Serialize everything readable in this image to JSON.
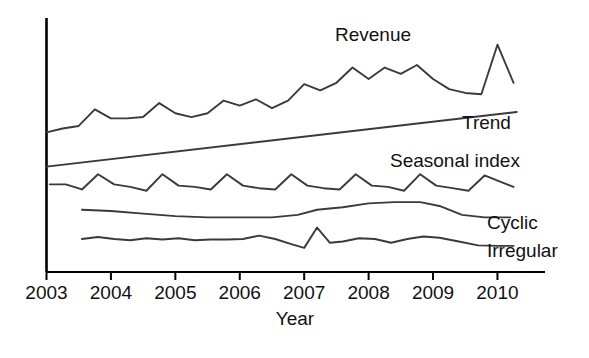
{
  "chart_data": {
    "type": "line",
    "title": "",
    "xlabel": "Year",
    "ylabel": "",
    "grid": false,
    "legend_position": "inline-right",
    "x_tick_labels": [
      "2003",
      "2004",
      "2005",
      "2006",
      "2007",
      "2008",
      "2009",
      "2010"
    ],
    "x_ticks": [
      2003,
      2004,
      2005,
      2006,
      2007,
      2008,
      2009,
      2010
    ],
    "xlim": [
      2003,
      2010.35
    ],
    "ylim": [
      0,
      100
    ],
    "y_axis_visible": true,
    "y_ticks_visible": false,
    "annotations": [
      {
        "text": "Revenue",
        "x": 2007.05,
        "y": 93
      },
      {
        "text": "Trend",
        "x": 2009.0,
        "y": 64
      },
      {
        "text": "Seasonal index",
        "x": 2007.8,
        "y": 49
      },
      {
        "text": "Cyclic",
        "x": 2009.3,
        "y": 24
      },
      {
        "text": "Irregular",
        "x": 2009.3,
        "y": 13
      }
    ],
    "series": [
      {
        "name": "Revenue",
        "label": "Revenue",
        "color": "#3a3a3a",
        "x": [
          2003.0,
          2003.25,
          2003.5,
          2003.75,
          2004.0,
          2004.25,
          2004.5,
          2004.75,
          2005.0,
          2005.25,
          2005.5,
          2005.75,
          2006.0,
          2006.25,
          2006.5,
          2006.75,
          2007.0,
          2007.25,
          2007.5,
          2007.75,
          2008.0,
          2008.25,
          2008.5,
          2008.75,
          2009.0,
          2009.25,
          2009.5,
          2009.75,
          2010.0,
          2010.25
        ],
        "values": [
          55.0,
          56.5,
          57.5,
          64.0,
          60.5,
          60.5,
          61.0,
          66.5,
          62.5,
          61.0,
          62.5,
          67.5,
          65.5,
          68.0,
          64.5,
          67.5,
          74.0,
          71.5,
          74.5,
          80.5,
          76.0,
          80.5,
          78.0,
          81.5,
          76.0,
          72.0,
          70.5,
          70.0,
          89.5,
          74.5
        ]
      },
      {
        "name": "Trend",
        "label": "Trend",
        "color": "#3a3a3a",
        "x": [
          2003.0,
          2010.3
        ],
        "values": [
          41.5,
          63.0
        ]
      },
      {
        "name": "Seasonal index",
        "label": "Seasonal index",
        "color": "#3a3a3a",
        "x": [
          2003.05,
          2003.3,
          2003.55,
          2003.8,
          2004.05,
          2004.3,
          2004.55,
          2004.8,
          2005.05,
          2005.3,
          2005.55,
          2005.8,
          2006.05,
          2006.3,
          2006.55,
          2006.8,
          2007.05,
          2007.3,
          2007.55,
          2007.8,
          2008.05,
          2008.3,
          2008.55,
          2008.8,
          2009.05,
          2009.3,
          2009.55,
          2009.8,
          2010.05,
          2010.25
        ],
        "values": [
          34.5,
          34.5,
          32.5,
          38.5,
          34.5,
          33.5,
          32.0,
          38.5,
          34.0,
          33.5,
          32.5,
          38.5,
          34.0,
          33.0,
          32.5,
          38.5,
          34.0,
          33.0,
          32.5,
          38.5,
          34.0,
          33.5,
          32.0,
          38.5,
          34.0,
          33.0,
          32.0,
          38.0,
          35.5,
          33.5
        ]
      },
      {
        "name": "Cyclic",
        "label": "Cyclic",
        "color": "#3a3a3a",
        "x": [
          2003.55,
          2004.0,
          2004.5,
          2005.0,
          2005.5,
          2006.0,
          2006.5,
          2006.9,
          2007.2,
          2007.6,
          2008.0,
          2008.4,
          2008.8,
          2009.1,
          2009.45,
          2009.8,
          2010.2
        ],
        "values": [
          24.5,
          24.0,
          23.0,
          22.0,
          21.5,
          21.5,
          21.5,
          22.5,
          24.5,
          25.5,
          27.0,
          27.5,
          27.5,
          26.0,
          22.5,
          21.5,
          21.5
        ]
      },
      {
        "name": "Irregular",
        "label": "Irregular",
        "color": "#3a3a3a",
        "x": [
          2003.55,
          2003.8,
          2004.05,
          2004.3,
          2004.55,
          2004.8,
          2005.05,
          2005.3,
          2005.55,
          2005.8,
          2006.05,
          2006.3,
          2006.55,
          2006.8,
          2007.0,
          2007.2,
          2007.4,
          2007.6,
          2007.85,
          2008.1,
          2008.35,
          2008.6,
          2008.85,
          2009.1,
          2009.4,
          2009.7,
          2010.0,
          2010.25
        ],
        "values": [
          13.0,
          13.8,
          13.0,
          12.5,
          13.3,
          12.8,
          13.3,
          12.5,
          12.8,
          12.8,
          13.0,
          14.3,
          13.0,
          11.0,
          9.5,
          17.5,
          11.5,
          12.0,
          13.3,
          13.0,
          11.5,
          13.0,
          14.0,
          13.5,
          12.0,
          10.5,
          10.3,
          10.3
        ]
      }
    ]
  },
  "labels": {
    "revenue": "Revenue",
    "trend": "Trend",
    "seasonal": "Seasonal index",
    "cyclic": "Cyclic",
    "irregular": "Irregular",
    "x_axis_title": "Year"
  },
  "colors": {
    "line": "#3a3a3a",
    "axis": "#000000",
    "text": "#111111",
    "background": "#ffffff"
  }
}
